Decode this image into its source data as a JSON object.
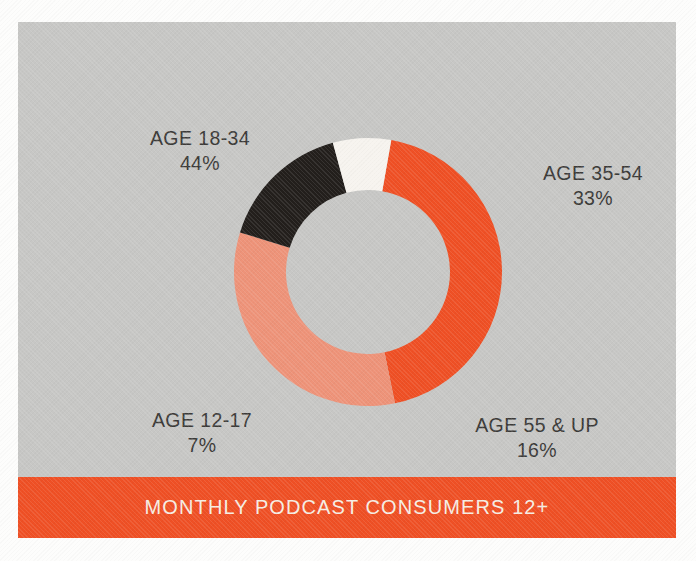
{
  "chart_data": {
    "type": "pie",
    "variant": "donut",
    "title": "MONTHLY PODCAST CONSUMERS 12+",
    "xlabel": "",
    "ylabel": "",
    "legend_position": "outside-labels",
    "grid": false,
    "start_angle_deg": 10,
    "direction": "clockwise",
    "categories": [
      "AGE 18-34",
      "AGE 35-54",
      "AGE 55 & UP",
      "AGE 12-17"
    ],
    "values": [
      44,
      33,
      16,
      7
    ],
    "value_suffix": "%",
    "colors": [
      "#ef5025",
      "#ee9379",
      "#231f1c",
      "#f7f4ef"
    ],
    "slices": [
      {
        "label": "AGE 18-34",
        "value": 44,
        "value_label": "44%",
        "color": "#ef5025"
      },
      {
        "label": "AGE 35-54",
        "value": 33,
        "value_label": "33%",
        "color": "#ee9379"
      },
      {
        "label": "AGE 55 & UP",
        "value": 16,
        "value_label": "16%",
        "color": "#231f1c"
      },
      {
        "label": "AGE 12-17",
        "value": 7,
        "value_label": "7%",
        "color": "#f7f4ef"
      }
    ]
  },
  "banner": {
    "title": "MONTHLY PODCAST CONSUMERS 12+",
    "background_color": "#ef5025",
    "text_color": "#f6eee4"
  },
  "panel": {
    "background_color": "#c7c7c5",
    "paper_color": "#fdfdfc"
  },
  "labels": {
    "age_18_34": {
      "name": "AGE 18-34",
      "pct": "44%"
    },
    "age_35_54": {
      "name": "AGE 35-54",
      "pct": "33%"
    },
    "age_12_17": {
      "name": "AGE 12-17",
      "pct": "7%"
    },
    "age_55_up": {
      "name": "AGE 55 & UP",
      "pct": "16%"
    }
  }
}
